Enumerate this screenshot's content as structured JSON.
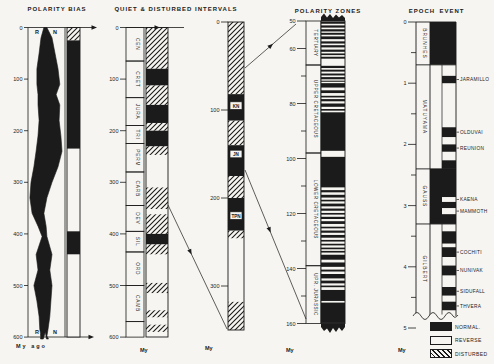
{
  "titles": {
    "polarity_bias": "POLARITY BIAS",
    "quiet_disturbed": "QUIET & DISTURBED INTERVALS",
    "polarity_zones": "POLARITY ZONES",
    "epoch": "EPOCH",
    "event": "EVENT"
  },
  "units": {
    "col1": "My ago",
    "col2": "My",
    "col3": "My",
    "col4": "My",
    "col5": "My"
  },
  "legend": {
    "items": [
      {
        "label": "NORMAL.",
        "fill": "black"
      },
      {
        "label": "REVERSE",
        "fill": "white"
      },
      {
        "label": "DISTURBED",
        "fill": "hatch"
      }
    ]
  },
  "colors": {
    "ink": "#1b1b1b",
    "paper": "#f6f5f1"
  },
  "polarity_bias": {
    "axis": {
      "min": 0,
      "max": 600,
      "step": 100
    },
    "labels_top": [
      "R",
      "N"
    ],
    "labels_bottom": [
      "R",
      "N"
    ],
    "curve": [
      [
        0,
        0.43,
        0.51
      ],
      [
        20,
        0.35,
        0.65
      ],
      [
        50,
        0.3,
        0.73
      ],
      [
        80,
        0.24,
        0.81
      ],
      [
        110,
        0.24,
        0.86
      ],
      [
        130,
        0.27,
        0.76
      ],
      [
        150,
        0.27,
        0.86
      ],
      [
        180,
        0.3,
        0.84
      ],
      [
        210,
        0.27,
        0.89
      ],
      [
        240,
        0.22,
        0.92
      ],
      [
        270,
        0.16,
        0.81
      ],
      [
        300,
        0.08,
        0.65
      ],
      [
        330,
        0.05,
        0.51
      ],
      [
        360,
        0.11,
        0.43
      ],
      [
        385,
        0.27,
        0.49
      ],
      [
        405,
        0.38,
        0.51
      ],
      [
        440,
        0.22,
        0.65
      ],
      [
        470,
        0.27,
        0.59
      ],
      [
        500,
        0.16,
        0.65
      ],
      [
        530,
        0.24,
        0.62
      ],
      [
        560,
        0.3,
        0.59
      ],
      [
        585,
        0.32,
        0.54
      ],
      [
        598,
        0.35,
        0.51
      ]
    ],
    "bar": [
      {
        "from": 0,
        "to": 25,
        "fill": "hatch"
      },
      {
        "from": 25,
        "to": 235,
        "fill": "black"
      },
      {
        "from": 235,
        "to": 395,
        "fill": "white"
      },
      {
        "from": 395,
        "to": 440,
        "fill": "black"
      },
      {
        "from": 440,
        "to": 600,
        "fill": "white"
      }
    ]
  },
  "quiet_disturbed": {
    "axis": {
      "min": 0,
      "max": 600,
      "step": 100
    },
    "periods": [
      {
        "name": "CEN",
        "from": 0,
        "to": 65
      },
      {
        "name": "CRET",
        "from": 65,
        "to": 136
      },
      {
        "name": "JURA",
        "from": 136,
        "to": 190
      },
      {
        "name": "TRI",
        "from": 190,
        "to": 225
      },
      {
        "name": "PERM",
        "from": 225,
        "to": 280
      },
      {
        "name": "CARB",
        "from": 280,
        "to": 345
      },
      {
        "name": "DEV",
        "from": 345,
        "to": 395
      },
      {
        "name": "SIL",
        "from": 395,
        "to": 435
      },
      {
        "name": "ORD",
        "from": 435,
        "to": 500
      },
      {
        "name": "CAMB",
        "from": 500,
        "to": 570
      },
      {
        "name": "",
        "from": 570,
        "to": 600
      }
    ],
    "bar": [
      {
        "from": 0,
        "to": 80,
        "fill": "hatch"
      },
      {
        "from": 80,
        "to": 112,
        "fill": "black"
      },
      {
        "from": 112,
        "to": 150,
        "fill": "hatch"
      },
      {
        "from": 150,
        "to": 185,
        "fill": "black"
      },
      {
        "from": 185,
        "to": 200,
        "fill": "hatch"
      },
      {
        "from": 200,
        "to": 230,
        "fill": "black"
      },
      {
        "from": 230,
        "to": 247,
        "fill": "hatch"
      },
      {
        "from": 247,
        "to": 310,
        "fill": "white"
      },
      {
        "from": 310,
        "to": 352,
        "fill": "hatch"
      },
      {
        "from": 352,
        "to": 362,
        "fill": "white"
      },
      {
        "from": 362,
        "to": 400,
        "fill": "hatch"
      },
      {
        "from": 400,
        "to": 420,
        "fill": "black"
      },
      {
        "from": 420,
        "to": 440,
        "fill": "hatch"
      },
      {
        "from": 440,
        "to": 495,
        "fill": "white"
      },
      {
        "from": 495,
        "to": 515,
        "fill": "hatch"
      },
      {
        "from": 515,
        "to": 548,
        "fill": "white"
      },
      {
        "from": 548,
        "to": 562,
        "fill": "hatch"
      },
      {
        "from": 562,
        "to": 576,
        "fill": "white"
      },
      {
        "from": 576,
        "to": 590,
        "fill": "hatch"
      },
      {
        "from": 590,
        "to": 600,
        "fill": "white"
      }
    ]
  },
  "detail": {
    "axis": {
      "min": 0,
      "max": 350,
      "step": 100
    },
    "bar": [
      {
        "from": 0,
        "to": 82,
        "fill": "hatch"
      },
      {
        "from": 82,
        "to": 112,
        "fill": "black"
      },
      {
        "from": 112,
        "to": 140,
        "fill": "hatch"
      },
      {
        "from": 140,
        "to": 175,
        "fill": "black"
      },
      {
        "from": 175,
        "to": 200,
        "fill": "hatch"
      },
      {
        "from": 200,
        "to": 237,
        "fill": "black"
      },
      {
        "from": 237,
        "to": 246,
        "fill": "hatch"
      },
      {
        "from": 246,
        "to": 318,
        "fill": "white"
      },
      {
        "from": 318,
        "to": 350,
        "fill": "hatch"
      }
    ],
    "zone_labels": [
      {
        "text": "KN",
        "at": 95
      },
      {
        "text": "JN",
        "at": 150
      },
      {
        "text": "TPN",
        "at": 220
      }
    ]
  },
  "polarity_zones": {
    "axis": {
      "min": 50,
      "max": 160,
      "labeled": [
        50,
        60,
        80,
        100,
        120,
        140,
        160
      ],
      "minor_step": 10
    },
    "stages": [
      {
        "name": "TERTIARY",
        "from": 50,
        "to": 66
      },
      {
        "name": "UPPER CRETACEOUS",
        "from": 66,
        "to": 98
      },
      {
        "name": "LOWER CRETACEOUS",
        "from": 98,
        "to": 139
      },
      {
        "name": "UPR. JURASSIC",
        "from": 139,
        "to": 160
      }
    ],
    "black_bands": [
      [
        50.2,
        51.0
      ],
      [
        51.6,
        52.4
      ],
      [
        53.0,
        53.8
      ],
      [
        54.3,
        55.0
      ],
      [
        55.6,
        56.6
      ],
      [
        57.4,
        58.2
      ],
      [
        58.8,
        59.6
      ],
      [
        60.4,
        61.2
      ],
      [
        61.8,
        62.4
      ],
      [
        63.0,
        63.7
      ],
      [
        66.3,
        67.1
      ],
      [
        67.7,
        68.4
      ],
      [
        69.1,
        69.8
      ],
      [
        70.4,
        71.2
      ],
      [
        71.7,
        72.1
      ],
      [
        72.6,
        74.2
      ],
      [
        75.2,
        76.2
      ],
      [
        77.2,
        77.8
      ],
      [
        78.4,
        79.2
      ],
      [
        80.0,
        81.2
      ],
      [
        82.0,
        82.6
      ],
      [
        83.2,
        97.2
      ],
      [
        99.4,
        110.5
      ],
      [
        111.5,
        112.3
      ],
      [
        113.2,
        114.2
      ],
      [
        115.0,
        115.6
      ],
      [
        116.4,
        117.4
      ],
      [
        118.2,
        119.0
      ],
      [
        119.8,
        120.4
      ],
      [
        121.2,
        122.0
      ],
      [
        122.8,
        123.8
      ],
      [
        124.8,
        125.4
      ],
      [
        126.2,
        127.0
      ],
      [
        127.8,
        128.8
      ],
      [
        129.6,
        130.2
      ],
      [
        131.0,
        131.6
      ],
      [
        132.4,
        133.0
      ],
      [
        133.6,
        134.2
      ],
      [
        135.0,
        136.8
      ],
      [
        137.8,
        139.4
      ],
      [
        140.4,
        141.1
      ],
      [
        142.0,
        143.6
      ],
      [
        144.4,
        145.4
      ],
      [
        146.2,
        146.8
      ],
      [
        147.8,
        151.8
      ],
      [
        152.4,
        159.8
      ]
    ]
  },
  "epoch_event": {
    "axis": {
      "min": 0,
      "max": 5,
      "step": 1,
      "minor_step": 0.5
    },
    "epochs": [
      {
        "name": "BRUNHES",
        "from": 0,
        "to": 0.7,
        "fill": "black"
      },
      {
        "name": "MATUYAMA",
        "from": 0.7,
        "to": 2.4,
        "fill": "white"
      },
      {
        "name": "GAUSS",
        "from": 2.4,
        "to": 3.3,
        "fill": "black"
      },
      {
        "name": "GILBERT",
        "from": 3.3,
        "to": 4.78,
        "fill": "white"
      }
    ],
    "events": [
      {
        "name": "JARAMILLO",
        "from": 0.88,
        "to": 1.0,
        "fill": "black"
      },
      {
        "name": "OLDUVAI",
        "from": 1.72,
        "to": 1.88,
        "fill": "black"
      },
      {
        "name": "REUNION",
        "from": 2.0,
        "to": 2.12,
        "fill": "black"
      },
      {
        "name": "",
        "from": 2.26,
        "to": 2.4,
        "fill": "black"
      },
      {
        "name": "KAENA",
        "from": 2.86,
        "to": 2.94,
        "fill": "white"
      },
      {
        "name": "MAMMOTH",
        "from": 3.04,
        "to": 3.14,
        "fill": "white"
      },
      {
        "name": "",
        "from": 3.42,
        "to": 3.62,
        "fill": "black"
      },
      {
        "name": "COCHITI",
        "from": 3.68,
        "to": 3.84,
        "fill": "black"
      },
      {
        "name": "NUNIVAK",
        "from": 3.98,
        "to": 4.14,
        "fill": "black"
      },
      {
        "name": "SIDUFALL",
        "from": 4.33,
        "to": 4.47,
        "fill": "black"
      },
      {
        "name": "THVERA",
        "from": 4.57,
        "to": 4.71,
        "fill": "black"
      }
    ]
  }
}
